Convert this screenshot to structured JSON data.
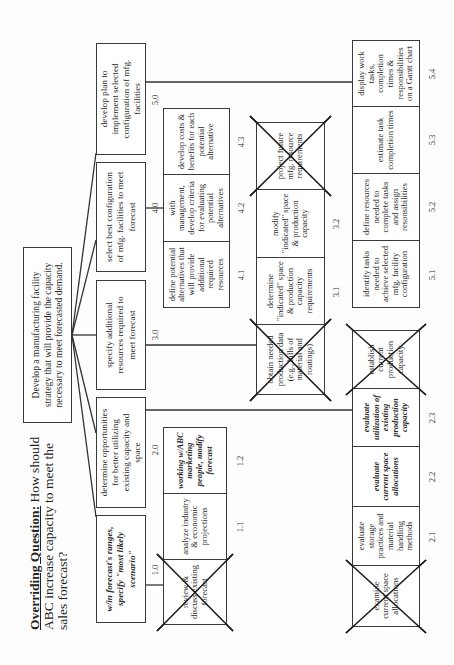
{
  "title": {
    "label": "Overriding Question:",
    "text": " How should ABC increase capacity to meet the sales forecast?"
  },
  "root": {
    "text": "Develop a manufacturing facility strategy that will provide the capacity necessary to meet forecasted demand."
  },
  "level1": [
    {
      "id": "1.0",
      "text": "w/in forecast's ranges, specify \"most likely scenario\"",
      "italic": true
    },
    {
      "id": "2.0",
      "text": "determine opportunities for better utilizing existing capacity and space",
      "italic": false
    },
    {
      "id": "3.0",
      "text": "specify additional resources required to meet forecast",
      "italic": false
    },
    {
      "id": "4.0",
      "text": "select best configuration of mfg. facilities to meet forecast",
      "italic": false
    },
    {
      "id": "5.0",
      "text": "develop plan to implement selected configuration of mfg. facilities",
      "italic": false
    }
  ],
  "group1": [
    {
      "id": "",
      "text": "review & discuss existing forecast",
      "crossed": true,
      "italic": false
    },
    {
      "id": "1.1",
      "text": "analyze industry & economic projections",
      "crossed": false,
      "italic": false
    },
    {
      "id": "1.2",
      "text": "working w/ABC marketing people, modify forecast",
      "crossed": false,
      "italic": true
    }
  ],
  "group2": [
    {
      "id": "",
      "text": "examine current space allocations",
      "crossed": true,
      "italic": false
    },
    {
      "id": "2.1",
      "text": "evaluate storage practices and material handling methods",
      "crossed": false,
      "italic": false
    },
    {
      "id": "2.2",
      "text": "evaluate current space allocations",
      "crossed": false,
      "italic": true
    },
    {
      "id": "2.3",
      "text": "evaluate utilization of existing production capacity",
      "crossed": false,
      "italic": true
    },
    {
      "id": "",
      "text": "establish current production capacity",
      "crossed": true,
      "italic": false
    }
  ],
  "group3": [
    {
      "id": "",
      "text": "obtain needed production data (e.g., bills of material and routings)",
      "crossed": true,
      "italic": false
    },
    {
      "id": "3.1",
      "text": "determine \"indicated\" space & production capacity requirements",
      "crossed": false,
      "italic": false
    },
    {
      "id": "3.2",
      "text": "modify \"indicated\" space & production capacity",
      "crossed": false,
      "italic": false
    },
    {
      "id": "",
      "text": "project future mfg. resource requirements",
      "crossed": true,
      "italic": false
    }
  ],
  "group4": [
    {
      "id": "4.1",
      "text": "define potential alternatives that will provide additional required resources",
      "crossed": false,
      "italic": false
    },
    {
      "id": "4.2",
      "text": "with management, develop criteria for evaluating potential alternatives",
      "crossed": false,
      "italic": false
    },
    {
      "id": "4.3",
      "text": "develop costs & benefits for each potential alternative",
      "crossed": false,
      "italic": false
    }
  ],
  "group5": [
    {
      "id": "5.1",
      "text": "identify tasks needed to achieve selected mfg. facility configuration",
      "crossed": false,
      "italic": false
    },
    {
      "id": "5.2",
      "text": "define resources needed to complete tasks and assign resonsibilities",
      "crossed": false,
      "italic": false
    },
    {
      "id": "5.3",
      "text": "estimate task completion times",
      "crossed": false,
      "italic": false
    },
    {
      "id": "5.4",
      "text": "display work tasks, completion times & responsibilities on a Gantt chart",
      "crossed": false,
      "italic": false
    }
  ],
  "colors": {
    "line": "#333333",
    "border": "#3a3a3a",
    "background": "#ffffff"
  }
}
